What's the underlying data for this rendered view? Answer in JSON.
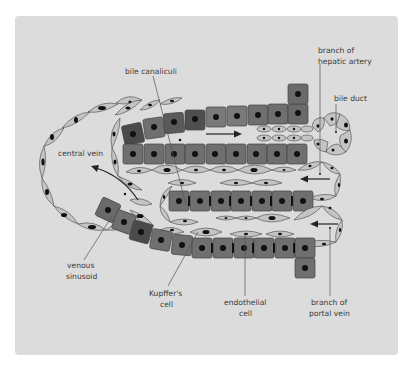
{
  "figure": {
    "type": "liver-lobule-microanatomy",
    "background_color": "#dcdcdc",
    "hepatocyte_colors": [
      "#6f6f6f",
      "#7a7a7a",
      "#5a5a5a",
      "#4a4a4a"
    ],
    "endothelial_color": "#c4c4c4",
    "nucleus_color": "#111111"
  },
  "labels": {
    "bile_canaliculi": "bile canaliculi",
    "hepatic_artery_line1": "branch of",
    "hepatic_artery_line2": "hepatic artery",
    "bile_duct": "bile duct",
    "central_vein": "central vein",
    "venous_sinusoid_line1": "venous",
    "venous_sinusoid_line2": "sinusoid",
    "kupffer_line1": "Kupffer's",
    "kupffer_line2": "cell",
    "endothelial_line1": "endothelial",
    "endothelial_line2": "cell",
    "portal_vein_line1": "branch of",
    "portal_vein_line2": "portal vein"
  },
  "arrows": [
    {
      "name": "bile-flow-arrow",
      "direction": "right"
    },
    {
      "name": "hepatic-artery-flow-arrow",
      "direction": "left"
    },
    {
      "name": "portal-vein-flow-arrow",
      "direction": "left"
    },
    {
      "name": "central-vein-flow-arrow",
      "direction": "up-left"
    }
  ]
}
